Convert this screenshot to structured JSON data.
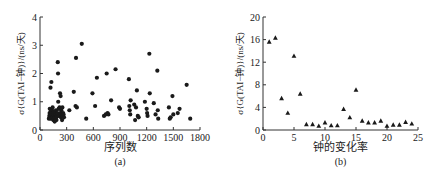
{
  "chart_data": [
    {
      "type": "scatter",
      "id": "a",
      "title": "",
      "sublabel": "(a)",
      "xlabel": "序列数",
      "ylabel": "σ{G(TAI−钟)}/(ns/天)",
      "xlim": [
        0,
        1800
      ],
      "ylim": [
        0,
        4
      ],
      "xticks": [
        0,
        300,
        600,
        900,
        1200,
        1500,
        1800
      ],
      "yticks": [
        0,
        1,
        2,
        3,
        4
      ],
      "marker": "circle",
      "grid": false,
      "points": [
        [
          100,
          0.4
        ],
        [
          105,
          0.5
        ],
        [
          108,
          0.6
        ],
        [
          110,
          0.75
        ],
        [
          112,
          0.45
        ],
        [
          115,
          0.55
        ],
        [
          118,
          1.5
        ],
        [
          120,
          0.4
        ],
        [
          122,
          0.65
        ],
        [
          125,
          0.5
        ],
        [
          128,
          1.7
        ],
        [
          130,
          0.6
        ],
        [
          133,
          0.45
        ],
        [
          135,
          0.7
        ],
        [
          138,
          0.55
        ],
        [
          140,
          0.4
        ],
        [
          142,
          0.8
        ],
        [
          145,
          0.5
        ],
        [
          148,
          0.6
        ],
        [
          150,
          0.35
        ],
        [
          152,
          0.45
        ],
        [
          155,
          0.55
        ],
        [
          158,
          0.65
        ],
        [
          160,
          0.4
        ],
        [
          163,
          0.5
        ],
        [
          165,
          0.3
        ],
        [
          168,
          0.45
        ],
        [
          170,
          0.6
        ],
        [
          173,
          0.5
        ],
        [
          175,
          0.4
        ],
        [
          178,
          0.55
        ],
        [
          180,
          0.7
        ],
        [
          183,
          0.45
        ],
        [
          185,
          0.35
        ],
        [
          190,
          0.5
        ],
        [
          195,
          0.6
        ],
        [
          200,
          2.4
        ],
        [
          203,
          2.0
        ],
        [
          205,
          1.0
        ],
        [
          210,
          0.75
        ],
        [
          215,
          0.5
        ],
        [
          220,
          0.8
        ],
        [
          225,
          1.3
        ],
        [
          228,
          0.6
        ],
        [
          232,
          1.2
        ],
        [
          235,
          0.45
        ],
        [
          240,
          0.7
        ],
        [
          245,
          0.55
        ],
        [
          248,
          0.35
        ],
        [
          252,
          0.8
        ],
        [
          255,
          0.5
        ],
        [
          260,
          0.6
        ],
        [
          265,
          0.55
        ],
        [
          270,
          0.45
        ],
        [
          330,
          0.7
        ],
        [
          380,
          1.35
        ],
        [
          400,
          0.85
        ],
        [
          405,
          2.55
        ],
        [
          415,
          0.8
        ],
        [
          470,
          3.05
        ],
        [
          520,
          0.4
        ],
        [
          590,
          1.3
        ],
        [
          620,
          0.85
        ],
        [
          640,
          1.85
        ],
        [
          720,
          0.5
        ],
        [
          740,
          0.55
        ],
        [
          750,
          2.0
        ],
        [
          760,
          0.6
        ],
        [
          770,
          0.55
        ],
        [
          800,
          1.05
        ],
        [
          850,
          2.15
        ],
        [
          890,
          0.8
        ],
        [
          900,
          0.75
        ],
        [
          1000,
          1.8
        ],
        [
          1005,
          0.85
        ],
        [
          1010,
          0.7
        ],
        [
          1015,
          0.55
        ],
        [
          1020,
          1.05
        ],
        [
          1060,
          0.9
        ],
        [
          1070,
          0.35
        ],
        [
          1080,
          0.8
        ],
        [
          1090,
          1.4
        ],
        [
          1100,
          0.5
        ],
        [
          1110,
          0.45
        ],
        [
          1180,
          1.0
        ],
        [
          1200,
          0.75
        ],
        [
          1205,
          0.6
        ],
        [
          1210,
          0.5
        ],
        [
          1230,
          2.7
        ],
        [
          1235,
          1.3
        ],
        [
          1280,
          0.95
        ],
        [
          1300,
          0.55
        ],
        [
          1320,
          2.1
        ],
        [
          1325,
          0.7
        ],
        [
          1330,
          0.4
        ],
        [
          1450,
          0.8
        ],
        [
          1460,
          0.4
        ],
        [
          1470,
          0.45
        ],
        [
          1490,
          1.2
        ],
        [
          1500,
          0.55
        ],
        [
          1550,
          0.6
        ],
        [
          1570,
          0.75
        ],
        [
          1650,
          1.6
        ],
        [
          1690,
          0.4
        ]
      ]
    },
    {
      "type": "scatter",
      "id": "b",
      "title": "",
      "sublabel": "(b)",
      "xlabel": "钟的变化率",
      "ylabel": "σ{G(TAI−钟)}/(ns/天)",
      "xlim": [
        0,
        25
      ],
      "ylim": [
        0,
        20
      ],
      "xticks": [
        0,
        5,
        10,
        15,
        20,
        25
      ],
      "yticks": [
        0,
        4,
        8,
        12,
        16,
        20
      ],
      "marker": "triangle",
      "grid": false,
      "points": [
        [
          1,
          15.6
        ],
        [
          2,
          16.3
        ],
        [
          3,
          5.6
        ],
        [
          4,
          3.0
        ],
        [
          5,
          13.1
        ],
        [
          6,
          6.4
        ],
        [
          7,
          1.0
        ],
        [
          8,
          1.0
        ],
        [
          9,
          0.7
        ],
        [
          10,
          1.3
        ],
        [
          11,
          0.8
        ],
        [
          12,
          0.8
        ],
        [
          13,
          3.7
        ],
        [
          14,
          2.2
        ],
        [
          15,
          7.1
        ],
        [
          16,
          1.6
        ],
        [
          17,
          1.3
        ],
        [
          18,
          1.3
        ],
        [
          19,
          1.6
        ],
        [
          20,
          0.7
        ],
        [
          21,
          0.9
        ],
        [
          22,
          0.9
        ],
        [
          23,
          1.4
        ],
        [
          24,
          1.1
        ]
      ]
    }
  ]
}
